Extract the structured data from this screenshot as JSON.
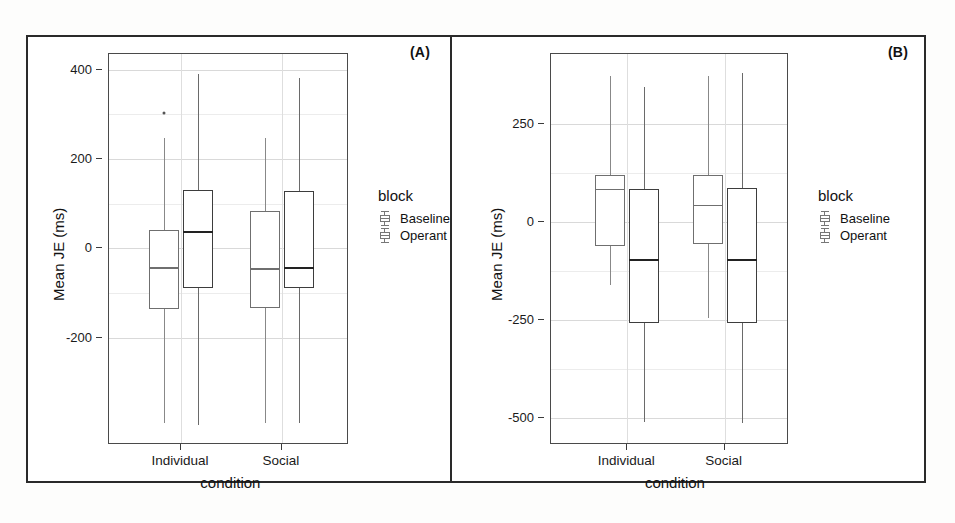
{
  "figure": {
    "panels": [
      {
        "tag": "(A)",
        "ylabel": "Mean JE (ms)",
        "xlabel": "condition",
        "yticks": [
          400,
          200,
          0,
          -200
        ],
        "ytick_labels": [
          "400",
          "200",
          "0",
          "-200"
        ],
        "xtick_labels": [
          "Individual",
          "Social"
        ],
        "legend_title": "block",
        "legend_items": [
          "Baseline",
          "Operant"
        ]
      },
      {
        "tag": "(B)",
        "ylabel": "Mean JE (ms)",
        "xlabel": "condition",
        "yticks": [
          250,
          0,
          -250,
          -500
        ],
        "ytick_labels": [
          "250",
          "0",
          "-250",
          "-500"
        ],
        "xtick_labels": [
          "Individual",
          "Social"
        ],
        "legend_title": "block",
        "legend_items": [
          "Baseline",
          "Operant"
        ]
      }
    ]
  },
  "chart_data": [
    {
      "type": "box",
      "title": "(A)",
      "xlabel": "condition",
      "ylabel": "Mean JE (ms)",
      "ylim": [
        -440,
        435
      ],
      "yticks": [
        400,
        200,
        0,
        -200
      ],
      "categories": [
        "Individual",
        "Social"
      ],
      "legend_title": "block",
      "legend_position": "right",
      "grid": true,
      "series": [
        {
          "name": "Baseline",
          "boxes": [
            {
              "category": "Individual",
              "whisker_low": -390,
              "q1": -135,
              "median": -42,
              "q3": 42,
              "whisker_high": 248,
              "outliers": [
                303
              ]
            },
            {
              "category": "Social",
              "whisker_low": -390,
              "q1": -133,
              "median": -45,
              "q3": 83,
              "whisker_high": 248,
              "outliers": []
            }
          ]
        },
        {
          "name": "Operant",
          "boxes": [
            {
              "category": "Individual",
              "whisker_low": -395,
              "q1": -88,
              "median": 40,
              "q3": 130,
              "whisker_high": 390,
              "outliers": []
            },
            {
              "category": "Social",
              "whisker_low": -390,
              "q1": -88,
              "median": -42,
              "q3": 128,
              "whisker_high": 382,
              "outliers": []
            }
          ]
        }
      ]
    },
    {
      "type": "box",
      "title": "(B)",
      "xlabel": "condition",
      "ylabel": "Mean JE (ms)",
      "ylim": [
        -570,
        430
      ],
      "yticks": [
        250,
        0,
        -250,
        -500
      ],
      "categories": [
        "Individual",
        "Social"
      ],
      "legend_title": "block",
      "legend_position": "right",
      "grid": true,
      "series": [
        {
          "name": "Baseline",
          "boxes": [
            {
              "category": "Individual",
              "whisker_low": -160,
              "q1": -60,
              "median": 85,
              "q3": 120,
              "whisker_high": 375,
              "outliers": []
            },
            {
              "category": "Social",
              "whisker_low": -245,
              "q1": -55,
              "median": 45,
              "q3": 120,
              "whisker_high": 375,
              "outliers": []
            }
          ]
        },
        {
          "name": "Operant",
          "boxes": [
            {
              "category": "Individual",
              "whisker_low": -510,
              "q1": -258,
              "median": -95,
              "q3": 85,
              "whisker_high": 345,
              "outliers": []
            },
            {
              "category": "Social",
              "whisker_low": -515,
              "q1": -258,
              "median": -95,
              "q3": 88,
              "whisker_high": 382,
              "outliers": []
            }
          ]
        }
      ]
    }
  ]
}
